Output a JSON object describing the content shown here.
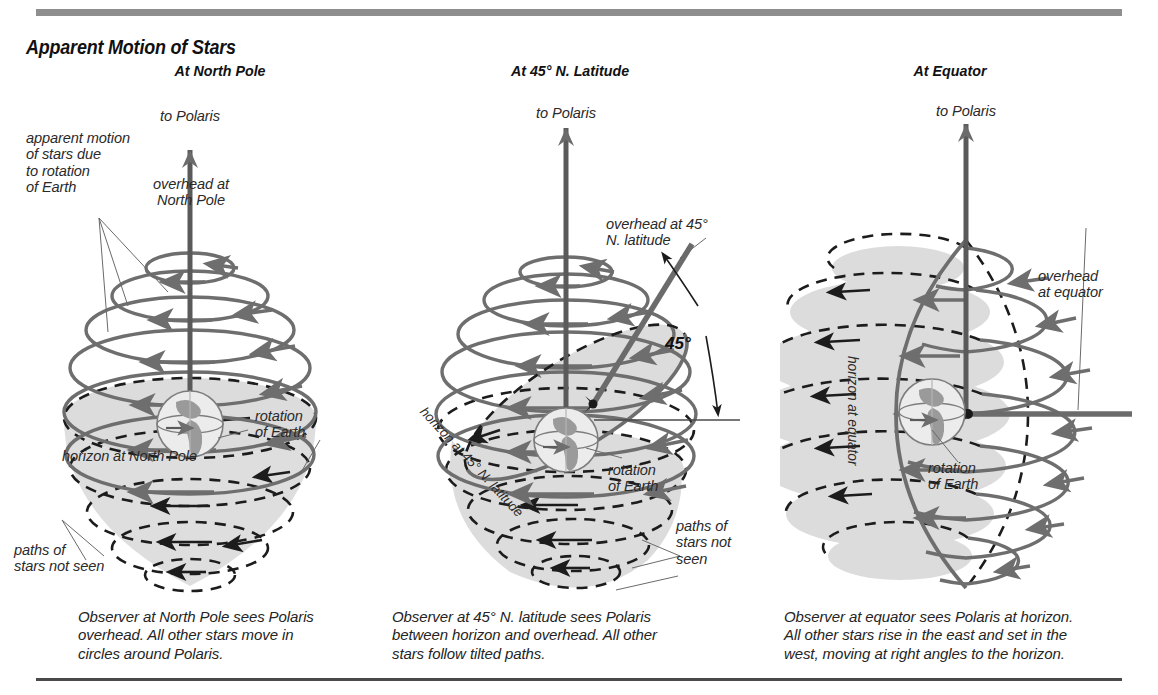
{
  "figure": {
    "title": "Apparent Motion of Stars",
    "colors": {
      "star_path": "#6e6e6e",
      "hidden_path": "#1c1c1c",
      "horizon_fill": "#dcdcdc",
      "axis_arrow": "#6b6b6b",
      "rule_top": "#8e8e8e",
      "rule_bottom": "#4a4a4a",
      "earth_land": "#9a9a9a",
      "text": "#242424"
    }
  },
  "panels": [
    {
      "id": "north-pole",
      "heading": "At North Pole",
      "labels": {
        "polaris": "to Polaris",
        "overhead": "overhead at\nNorth Pole",
        "apparent_motion": "apparent motion\nof stars due\nto rotation\nof Earth",
        "rotation": "rotation\nof Earth",
        "horizon": "horizon at North Pole",
        "paths_not_seen": "paths of\nstars not seen"
      },
      "caption": "Observer at North Pole sees Polaris\noverhead. All other stars move in\ncircles around Polaris."
    },
    {
      "id": "45-north",
      "heading": "At 45° N. Latitude",
      "labels": {
        "polaris": "to Polaris",
        "overhead": "overhead at 45°\nN. latitude",
        "angle": "45°",
        "rotation": "rotation\nof Earth",
        "horizon": "horizon at 45° N. latitude",
        "paths_not_seen": "paths of\nstars not\nseen"
      },
      "caption": "Observer at 45° N. latitude sees Polaris\nbetween horizon and overhead. All other\nstars follow tilted paths."
    },
    {
      "id": "equator",
      "heading": "At Equator",
      "labels": {
        "polaris": "to Polaris",
        "overhead": "overhead\nat equator",
        "rotation": "rotation\nof Earth",
        "horizon": "horizon at equator"
      },
      "caption": "Observer at equator sees Polaris at horizon.\nAll other stars rise in the east and set in the\nwest, moving at right angles to the horizon."
    }
  ]
}
